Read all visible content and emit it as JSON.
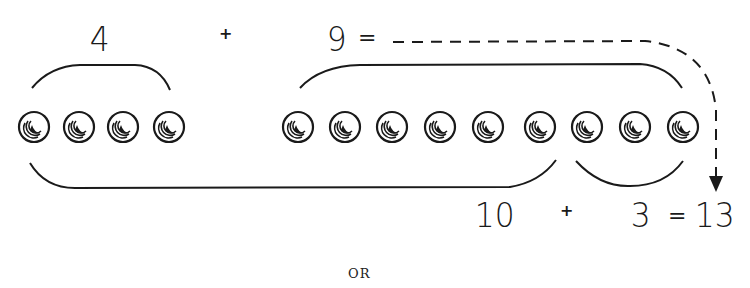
{
  "top_equation": {
    "addend1": "4",
    "plus": "+",
    "addend2": "9",
    "equals": "="
  },
  "bottom_equation": {
    "addend1": "10",
    "plus": "+",
    "addend2": "3",
    "equals": "=",
    "sum": "13"
  },
  "separator_text": "OR",
  "beads": {
    "left_group_count": 4,
    "right_group_count": 9,
    "left_group_x": [
      34,
      79,
      123,
      169
    ],
    "right_group_x": [
      298,
      345,
      392,
      440,
      488,
      540,
      587,
      635,
      683
    ],
    "y": 127,
    "radius": 15
  },
  "colors": {
    "ink": "#1a1a1a",
    "background": "#ffffff"
  }
}
